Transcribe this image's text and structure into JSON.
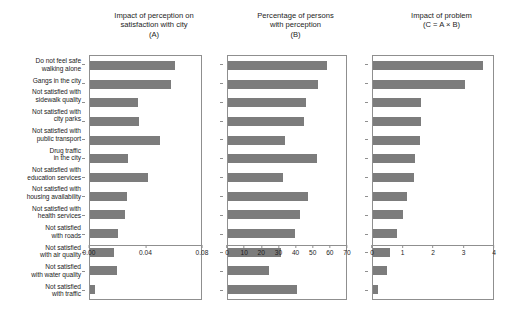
{
  "chart_data": {
    "type": "bar",
    "title": "",
    "orientation": "horizontal",
    "grid": false,
    "legend": null,
    "categories": [
      "Do not feel safe\nwalking alone",
      "Gangs in the city",
      "Not satisfied with\nsidewalk quality",
      "Not satisfied with\ncity parks",
      "Not satisfied with\npublic transport",
      "Drug traffic\nin the city",
      "Not satisfied with\neducation services",
      "Not satisfied with\nhousing availability",
      "Not satisfied with\nhealth services",
      "Not satisfied\nwith roads",
      "Not satisfied\nwith air quality",
      "Not satisfied\nwith water quality",
      "Not satisfied\nwith traffic"
    ],
    "panels": [
      {
        "key": "A",
        "title": "Impact of perception on\nsatisfaction with city\n(A)",
        "xlabel": "",
        "ylabel": "",
        "xlim": [
          0.0,
          0.08
        ],
        "xticks": [
          0.0,
          0.04,
          0.08
        ],
        "xticklabels": [
          "0.00",
          "0.04",
          "0.08"
        ],
        "values": [
          0.0615,
          0.0585,
          0.0345,
          0.0355,
          0.0505,
          0.0275,
          0.0415,
          0.0265,
          0.0255,
          0.0205,
          0.0175,
          0.0195,
          0.0035
        ]
      },
      {
        "key": "B",
        "title": "Percentage of persons\nwith perception\n(B)",
        "xlabel": "",
        "ylabel": "",
        "xlim": [
          0,
          70
        ],
        "xticks": [
          0,
          10,
          20,
          30,
          40,
          50,
          60,
          70
        ],
        "xticklabels": [
          "0",
          "10",
          "20",
          "30",
          "40",
          "50",
          "60",
          "70"
        ],
        "values": [
          59.0,
          53.5,
          46.0,
          45.0,
          34.0,
          52.5,
          32.5,
          47.5,
          43.0,
          39.5,
          31.5,
          24.5,
          41.0
        ]
      },
      {
        "key": "C",
        "title": "Impact of problem\n(C = A × B)",
        "xlabel": "",
        "ylabel": "",
        "xlim": [
          0,
          4
        ],
        "xticks": [
          0,
          1,
          2,
          3,
          4
        ],
        "xticklabels": [
          "0",
          "1",
          "2",
          "3",
          "4"
        ],
        "values": [
          3.67,
          3.08,
          1.6,
          1.6,
          1.58,
          1.4,
          1.38,
          1.12,
          1.0,
          0.8,
          0.55,
          0.45,
          0.16
        ]
      }
    ],
    "colors": {
      "bar": "#7c7c7c",
      "axis": "#8f8f8f",
      "text": "#1c1c1c",
      "background": "#ffffff"
    }
  }
}
